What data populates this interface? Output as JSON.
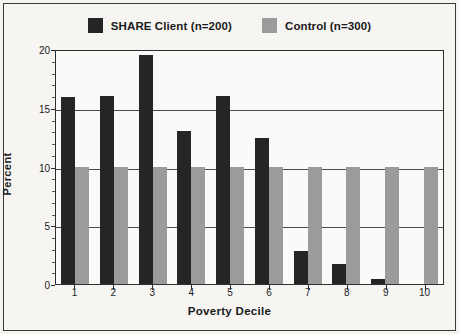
{
  "figure": {
    "background_color": "#f6f5f2",
    "border_color": "#3a3a3a"
  },
  "legend": {
    "position": "top-center",
    "entries": [
      {
        "label": "SHARE Client (n=200)",
        "color": "#252525",
        "swatch_name": "legend-swatch-share-client"
      },
      {
        "label": "Control (n=300)",
        "color": "#9b9b9b",
        "swatch_name": "legend-swatch-control"
      }
    ]
  },
  "axes": {
    "ylabel": "Percent",
    "xlabel": "Poverty Decile",
    "yticks": [
      "0",
      "5",
      "10",
      "15",
      "20"
    ],
    "xticks": [
      "1",
      "2",
      "3",
      "4",
      "5",
      "6",
      "7",
      "8",
      "9",
      "10"
    ]
  },
  "chart_data": {
    "type": "bar",
    "title": "",
    "subtitle": "",
    "xlabel": "Poverty Decile",
    "ylabel": "Percent",
    "ylim": [
      0,
      20
    ],
    "ytick_values": [
      0,
      5,
      10,
      15,
      20
    ],
    "grid": true,
    "grid_axis": "y",
    "legend_position": "top-center",
    "categories": [
      "1",
      "2",
      "3",
      "4",
      "5",
      "6",
      "7",
      "8",
      "9",
      "10"
    ],
    "series": [
      {
        "name": "SHARE Client (n=200)",
        "color": "#252525",
        "values": [
          15.9,
          16.0,
          19.5,
          13.0,
          16.0,
          12.4,
          2.8,
          1.7,
          0.4,
          0
        ]
      },
      {
        "name": "Control (n=300)",
        "color": "#9b9b9b",
        "values": [
          10,
          10,
          10,
          10,
          10,
          10,
          10,
          10,
          10,
          10
        ]
      }
    ]
  }
}
